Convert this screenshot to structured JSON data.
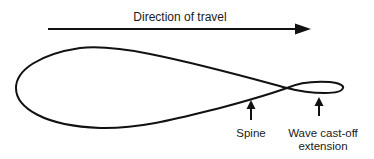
{
  "diagram": {
    "title": "Direction of travel",
    "labels": {
      "spine": "Spine",
      "wave_line1": "Wave cast-off",
      "wave_line2": "extension"
    },
    "elements": [
      {
        "type": "arrow",
        "direction": "right",
        "label": "Direction of travel"
      },
      {
        "type": "curve",
        "shape": "teardrop-loop with figure-eight crossing and small trailing loop"
      },
      {
        "type": "arrow",
        "direction": "up",
        "label": "Spine"
      },
      {
        "type": "arrow",
        "direction": "up",
        "label": "Wave cast-off extension"
      }
    ],
    "colors": {
      "stroke": "#111111",
      "background": "#ffffff",
      "text": "#1a1a1a"
    }
  }
}
